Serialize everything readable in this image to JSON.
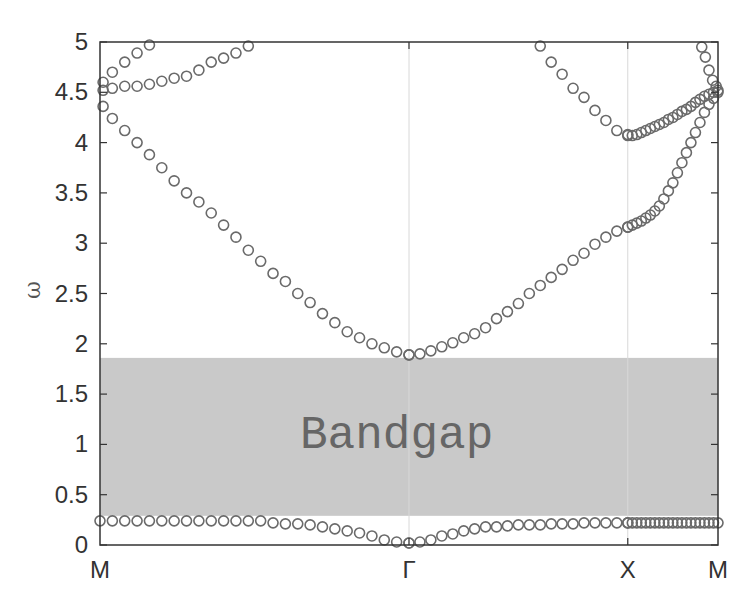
{
  "chart_data": {
    "type": "scatter",
    "title": "",
    "xlabel": "",
    "ylabel": "ω",
    "ylim": [
      0,
      5
    ],
    "yticks": [
      "0",
      "0.5",
      "1",
      "1.5",
      "2",
      "2.5",
      "3",
      "3.5",
      "4",
      "4.5",
      "5"
    ],
    "xticks": [
      {
        "label": "M",
        "k": 0.0
      },
      {
        "label": "Γ",
        "k": 0.5
      },
      {
        "label": "X",
        "k": 0.854
      },
      {
        "label": "M",
        "k": 1.0
      }
    ],
    "grid": "vertical lines at symmetry points",
    "annotation": {
      "text": "Bandgap",
      "omega_low": 0.29,
      "omega_high": 1.86
    },
    "marker": "open circle",
    "series": [
      {
        "name": "band1",
        "segments": [
          {
            "from": "M",
            "to": "Γ",
            "points": [
              [
                0,
                0.24
              ],
              [
                0.04,
                0.24
              ],
              [
                0.08,
                0.24
              ],
              [
                0.12,
                0.24
              ],
              [
                0.16,
                0.24
              ],
              [
                0.2,
                0.24
              ],
              [
                0.24,
                0.24
              ],
              [
                0.28,
                0.24
              ],
              [
                0.32,
                0.24
              ],
              [
                0.36,
                0.24
              ],
              [
                0.4,
                0.24
              ],
              [
                0.44,
                0.24
              ],
              [
                0.48,
                0.24
              ],
              [
                0.52,
                0.24
              ],
              [
                0.56,
                0.22
              ],
              [
                0.6,
                0.21
              ],
              [
                0.64,
                0.21
              ],
              [
                0.68,
                0.2
              ],
              [
                0.72,
                0.18
              ],
              [
                0.76,
                0.16
              ],
              [
                0.8,
                0.14
              ],
              [
                0.84,
                0.12
              ],
              [
                0.88,
                0.09
              ],
              [
                0.92,
                0.05
              ],
              [
                0.96,
                0.03
              ],
              [
                1.0,
                0.02
              ]
            ]
          },
          {
            "from": "Γ",
            "to": "X",
            "points": [
              [
                0.0,
                0.02
              ],
              [
                0.05,
                0.03
              ],
              [
                0.1,
                0.05
              ],
              [
                0.15,
                0.09
              ],
              [
                0.2,
                0.11
              ],
              [
                0.25,
                0.14
              ],
              [
                0.3,
                0.16
              ],
              [
                0.35,
                0.18
              ],
              [
                0.4,
                0.18
              ],
              [
                0.45,
                0.19
              ],
              [
                0.5,
                0.2
              ],
              [
                0.55,
                0.2
              ],
              [
                0.6,
                0.2
              ],
              [
                0.65,
                0.21
              ],
              [
                0.7,
                0.21
              ],
              [
                0.75,
                0.21
              ],
              [
                0.8,
                0.22
              ],
              [
                0.85,
                0.22
              ],
              [
                0.9,
                0.22
              ],
              [
                0.95,
                0.22
              ],
              [
                1.0,
                0.22
              ]
            ]
          },
          {
            "from": "X",
            "to": "M",
            "points": [
              [
                0.0,
                0.22
              ],
              [
                0.05,
                0.22
              ],
              [
                0.1,
                0.22
              ],
              [
                0.15,
                0.22
              ],
              [
                0.2,
                0.22
              ],
              [
                0.25,
                0.22
              ],
              [
                0.3,
                0.22
              ],
              [
                0.35,
                0.22
              ],
              [
                0.4,
                0.22
              ],
              [
                0.45,
                0.22
              ],
              [
                0.5,
                0.22
              ],
              [
                0.55,
                0.22
              ],
              [
                0.6,
                0.22
              ],
              [
                0.65,
                0.22
              ],
              [
                0.7,
                0.22
              ],
              [
                0.75,
                0.22
              ],
              [
                0.8,
                0.22
              ],
              [
                0.85,
                0.22
              ],
              [
                0.9,
                0.22
              ],
              [
                0.95,
                0.22
              ],
              [
                1.0,
                0.22
              ]
            ]
          }
        ]
      },
      {
        "name": "band2",
        "segments": [
          {
            "from": "M",
            "to": "Γ",
            "points": [
              [
                0.01,
                4.36
              ],
              [
                0.04,
                4.24
              ],
              [
                0.08,
                4.12
              ],
              [
                0.12,
                4.0
              ],
              [
                0.16,
                3.88
              ],
              [
                0.2,
                3.75
              ],
              [
                0.24,
                3.62
              ],
              [
                0.28,
                3.5
              ],
              [
                0.32,
                3.41
              ],
              [
                0.36,
                3.3
              ],
              [
                0.4,
                3.18
              ],
              [
                0.44,
                3.06
              ],
              [
                0.48,
                2.93
              ],
              [
                0.52,
                2.82
              ],
              [
                0.56,
                2.7
              ],
              [
                0.6,
                2.62
              ],
              [
                0.64,
                2.5
              ],
              [
                0.68,
                2.41
              ],
              [
                0.72,
                2.3
              ],
              [
                0.76,
                2.21
              ],
              [
                0.8,
                2.12
              ],
              [
                0.84,
                2.06
              ],
              [
                0.88,
                2.0
              ],
              [
                0.92,
                1.96
              ],
              [
                0.96,
                1.92
              ],
              [
                1.0,
                1.89
              ]
            ]
          },
          {
            "from": "Γ",
            "to": "X",
            "points": [
              [
                0.0,
                1.89
              ],
              [
                0.05,
                1.9
              ],
              [
                0.1,
                1.93
              ],
              [
                0.15,
                1.97
              ],
              [
                0.2,
                2.01
              ],
              [
                0.25,
                2.06
              ],
              [
                0.3,
                2.1
              ],
              [
                0.35,
                2.16
              ],
              [
                0.4,
                2.25
              ],
              [
                0.45,
                2.32
              ],
              [
                0.5,
                2.4
              ],
              [
                0.55,
                2.5
              ],
              [
                0.6,
                2.58
              ],
              [
                0.65,
                2.66
              ],
              [
                0.7,
                2.74
              ],
              [
                0.75,
                2.83
              ],
              [
                0.8,
                2.9
              ],
              [
                0.85,
                2.99
              ],
              [
                0.9,
                3.06
              ],
              [
                0.95,
                3.12
              ],
              [
                1.0,
                3.16
              ]
            ]
          },
          {
            "from": "X",
            "to": "M",
            "points": [
              [
                0.0,
                3.16
              ],
              [
                0.05,
                3.18
              ],
              [
                0.1,
                3.2
              ],
              [
                0.15,
                3.22
              ],
              [
                0.2,
                3.25
              ],
              [
                0.25,
                3.28
              ],
              [
                0.3,
                3.32
              ],
              [
                0.35,
                3.37
              ],
              [
                0.4,
                3.44
              ],
              [
                0.45,
                3.52
              ],
              [
                0.5,
                3.6
              ],
              [
                0.55,
                3.7
              ],
              [
                0.6,
                3.8
              ],
              [
                0.65,
                3.9
              ],
              [
                0.7,
                4.0
              ],
              [
                0.75,
                4.1
              ],
              [
                0.8,
                4.2
              ],
              [
                0.85,
                4.3
              ],
              [
                0.9,
                4.38
              ],
              [
                0.95,
                4.44
              ],
              [
                1.0,
                4.5
              ]
            ]
          }
        ]
      },
      {
        "name": "band3",
        "segments": [
          {
            "from": "M",
            "to": "Γ",
            "points": [
              [
                0.01,
                4.52
              ],
              [
                0.04,
                4.54
              ],
              [
                0.08,
                4.56
              ],
              [
                0.12,
                4.56
              ],
              [
                0.16,
                4.58
              ],
              [
                0.2,
                4.61
              ],
              [
                0.24,
                4.64
              ],
              [
                0.28,
                4.66
              ],
              [
                0.32,
                4.72
              ],
              [
                0.36,
                4.8
              ],
              [
                0.4,
                4.84
              ],
              [
                0.44,
                4.89
              ],
              [
                0.48,
                4.96
              ]
            ]
          },
          {
            "from": "Γ",
            "to": "X",
            "points": [
              [
                0.6,
                4.96
              ],
              [
                0.65,
                4.8
              ],
              [
                0.7,
                4.68
              ],
              [
                0.75,
                4.54
              ],
              [
                0.8,
                4.45
              ],
              [
                0.85,
                4.32
              ],
              [
                0.9,
                4.22
              ],
              [
                0.95,
                4.12
              ],
              [
                1.0,
                4.08
              ]
            ]
          },
          {
            "from": "X",
            "to": "M",
            "points": [
              [
                0.0,
                4.07
              ],
              [
                0.05,
                4.07
              ],
              [
                0.1,
                4.08
              ],
              [
                0.15,
                4.1
              ],
              [
                0.2,
                4.12
              ],
              [
                0.25,
                4.14
              ],
              [
                0.3,
                4.16
              ],
              [
                0.35,
                4.18
              ],
              [
                0.4,
                4.2
              ],
              [
                0.45,
                4.23
              ],
              [
                0.5,
                4.25
              ],
              [
                0.55,
                4.28
              ],
              [
                0.6,
                4.31
              ],
              [
                0.65,
                4.33
              ],
              [
                0.7,
                4.36
              ],
              [
                0.75,
                4.4
              ],
              [
                0.8,
                4.43
              ],
              [
                0.85,
                4.46
              ],
              [
                0.9,
                4.48
              ],
              [
                0.95,
                4.5
              ],
              [
                1.0,
                4.52
              ]
            ]
          }
        ]
      },
      {
        "name": "band4",
        "segments": [
          {
            "from": "M",
            "to": "Γ",
            "points": [
              [
                0.01,
                4.6
              ],
              [
                0.04,
                4.7
              ],
              [
                0.08,
                4.8
              ],
              [
                0.12,
                4.89
              ],
              [
                0.16,
                4.97
              ]
            ]
          },
          {
            "from": "X",
            "to": "M",
            "points": [
              [
                0.82,
                4.95
              ],
              [
                0.86,
                4.85
              ],
              [
                0.9,
                4.72
              ],
              [
                0.94,
                4.62
              ],
              [
                0.98,
                4.56
              ]
            ]
          }
        ]
      }
    ]
  },
  "axis": {
    "ylabel": "ω",
    "yticks": [
      "0",
      "0.5",
      "1",
      "1.5",
      "2",
      "2.5",
      "3",
      "3.5",
      "4",
      "4.5",
      "5"
    ],
    "xticks": [
      "M",
      "Γ",
      "X",
      "M"
    ]
  },
  "annotation": {
    "text": "Bandgap"
  },
  "colors": {
    "marker": "#6a6a6a",
    "gap": "#c9c9c9",
    "axis": "#333333",
    "text": "#333333",
    "gap_text": "#666666"
  }
}
